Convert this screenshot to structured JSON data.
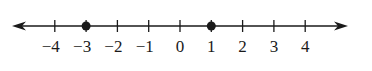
{
  "number_line": {
    "min_label": -4,
    "max_label": 4,
    "ticks": [
      {
        "value": -4,
        "label": "−4"
      },
      {
        "value": -3,
        "label": "−3"
      },
      {
        "value": -2,
        "label": "−2"
      },
      {
        "value": -1,
        "label": "−1"
      },
      {
        "value": 0,
        "label": "0"
      },
      {
        "value": 1,
        "label": "1"
      },
      {
        "value": 2,
        "label": "2"
      },
      {
        "value": 3,
        "label": "3"
      },
      {
        "value": 4,
        "label": "4"
      }
    ],
    "points": [
      {
        "value": -3,
        "style": "closed-dot"
      },
      {
        "value": 1,
        "style": "closed-dot"
      }
    ],
    "arrows": [
      "left",
      "right"
    ],
    "color": "#1a1a1a"
  }
}
